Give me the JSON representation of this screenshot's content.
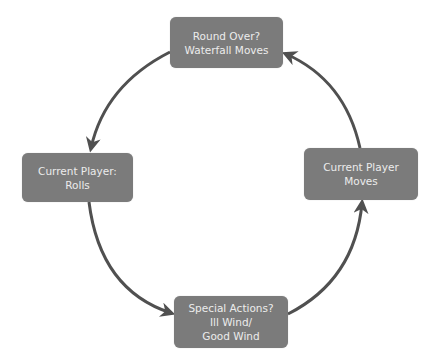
{
  "diagram": {
    "type": "cycle",
    "colors": {
      "node_fill": "#7b7b7b",
      "node_text": "#ececec",
      "arrow": "#505050"
    },
    "nodes": [
      {
        "id": "top",
        "lines": [
          "Round Over?",
          "Waterfall Moves"
        ]
      },
      {
        "id": "left",
        "lines": [
          "Current Player:",
          "Rolls"
        ]
      },
      {
        "id": "bottom",
        "lines": [
          "Special Actions?",
          "Ill Wind/",
          "Good Wind"
        ]
      },
      {
        "id": "right",
        "lines": [
          "Current Player",
          "Moves"
        ]
      }
    ],
    "edges": [
      {
        "from": "top",
        "to": "left"
      },
      {
        "from": "left",
        "to": "bottom"
      },
      {
        "from": "bottom",
        "to": "right"
      },
      {
        "from": "right",
        "to": "top"
      }
    ]
  }
}
